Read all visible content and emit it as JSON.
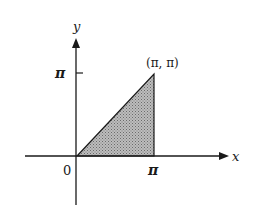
{
  "diagram": {
    "type": "coordinate-plane-region",
    "axes": {
      "x_label": "x",
      "y_label": "y",
      "origin_label": "0"
    },
    "ticks": {
      "x_tick_label": "π",
      "y_tick_label": "π"
    },
    "region": {
      "shape": "triangle",
      "vertices": [
        [
          0,
          0
        ],
        [
          "π",
          "π"
        ],
        [
          "π",
          0
        ]
      ],
      "fill": "stippled gray",
      "fill_color": "#a8a8a8"
    },
    "point_label": "(π, π)",
    "colors": {
      "ink": "#1a1a1a",
      "background": "#ffffff"
    }
  }
}
